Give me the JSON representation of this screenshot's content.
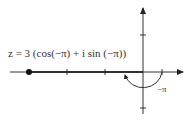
{
  "diagram": {
    "equation_label": "z = 3 (cos(−π) + i sin (−π))",
    "angle_label": "−π",
    "point": {
      "modulus": 3,
      "argument": "−π",
      "position": "negative real axis"
    },
    "axes": {
      "real_ticks": [
        "−3",
        "−2",
        "−1",
        "1"
      ],
      "imag_ticks": [
        "1",
        "−1"
      ]
    },
    "colors": {
      "ink": "#333333",
      "background": "#ffffff"
    }
  }
}
